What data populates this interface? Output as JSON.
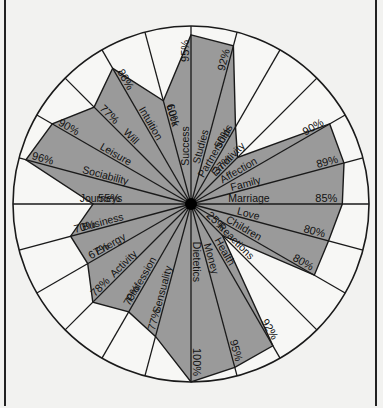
{
  "chart_data": {
    "type": "radar",
    "title": "",
    "center": [
      191,
      204
    ],
    "radius": 178,
    "start_angle_deg": 0,
    "direction": "clockwise",
    "max_value": 100,
    "categories": [
      "Success",
      "Studies",
      "Partnerships",
      "Emotivity",
      "Affection",
      "Family",
      "Marriage",
      "Love",
      "Children",
      "Reactions",
      "Health",
      "Money",
      "Dietetics",
      "Sensuality",
      "Profession",
      "Activity",
      "Energy",
      "Business",
      "Journeys",
      "Sociability",
      "Leisure",
      "Will",
      "Intuition",
      "Luck"
    ],
    "values": [
      95,
      92,
      50,
      37,
      90,
      89,
      85,
      80,
      80,
      25,
      92,
      95,
      100,
      77,
      70,
      78,
      67,
      70,
      55,
      96,
      90,
      77,
      88,
      60
    ],
    "value_labels": [
      "95%",
      "92%",
      "50%",
      "37%",
      "90%",
      "89%",
      "85%",
      "80%",
      "80%",
      "25%",
      "92%",
      "95%",
      "100%",
      "77%",
      "70%",
      "78%",
      "67%",
      "70%",
      "55%",
      "96%",
      "90%",
      "77%",
      "88%",
      "60%"
    ],
    "fill_color": "#9a9a9a",
    "background_color": "#f2f2f0",
    "line_color": "#1a1a1a",
    "grid": false,
    "legend": null
  }
}
